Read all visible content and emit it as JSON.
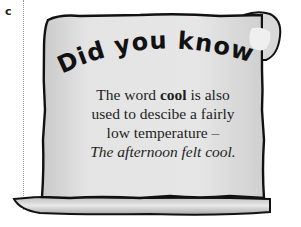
{
  "section_letter": "c",
  "card": {
    "heading": "Did you know?",
    "body": {
      "line1_pre": "The word ",
      "keyword": "cool",
      "line1_post": " is also",
      "line2": "used to descibe a fairly",
      "line3": "low temperature –",
      "example": "The afternoon felt cool."
    }
  },
  "colors": {
    "paper": "#e2e2e2",
    "outline": "#111111",
    "text": "#1e1e1e"
  }
}
